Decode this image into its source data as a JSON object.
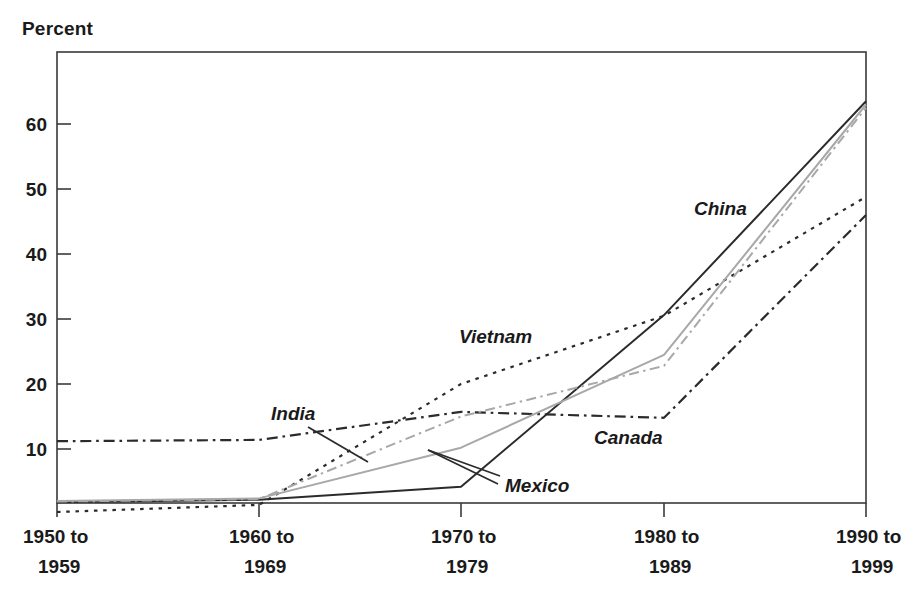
{
  "chart_data": {
    "type": "line",
    "title": "",
    "ylabel": "Percent",
    "xlabel": "",
    "ylim": [
      0,
      68
    ],
    "yticks": [
      10,
      20,
      30,
      40,
      50,
      60
    ],
    "ytick_labels": [
      "10",
      "20",
      "30",
      "40",
      "50",
      "60"
    ],
    "grid": false,
    "legend_position": "inline-annotations",
    "categories": [
      "1950 to 1959",
      "1960 to 1969",
      "1970 to 1979",
      "1980 to 1989",
      "1990 to 1999"
    ],
    "xtick_labels": [
      {
        "line1": "1950 to",
        "line2": "1959"
      },
      {
        "line1": "1960 to",
        "line2": "1969"
      },
      {
        "line1": "1970 to",
        "line2": "1979"
      },
      {
        "line1": "1980 to",
        "line2": "1989"
      },
      {
        "line1": "1990 to",
        "line2": "1999"
      }
    ],
    "series": [
      {
        "name": "China",
        "label": "China",
        "style": "solid",
        "color": "#2b2b2b",
        "width": 2.0,
        "values": [
          1.8,
          2.2,
          4.2,
          30.6,
          63.5
        ]
      },
      {
        "name": "Vietnam",
        "label": "Vietnam",
        "style": "dotted",
        "color": "#2b2b2b",
        "width": 2.2,
        "values": [
          0.3,
          1.4,
          20.0,
          30.5,
          48.8
        ]
      },
      {
        "name": "Canada",
        "label": "Canada",
        "style": "dashdot",
        "color": "#2b2b2b",
        "width": 2.2,
        "values": [
          11.2,
          11.4,
          15.7,
          14.8,
          46.0
        ]
      },
      {
        "name": "Mexico",
        "label": "Mexico",
        "style": "solid",
        "color": "#a8a8a8",
        "width": 2.0,
        "values": [
          2.0,
          2.4,
          10.2,
          24.5,
          63.0
        ]
      },
      {
        "name": "India",
        "label": "India",
        "style": "dashdot",
        "color": "#a8a8a8",
        "width": 2.0,
        "values": [
          1.9,
          2.3,
          15.0,
          22.8,
          62.5
        ]
      }
    ],
    "annotations": [
      {
        "text": "China",
        "series": "China"
      },
      {
        "text": "Vietnam",
        "series": "Vietnam"
      },
      {
        "text": "Canada",
        "series": "Canada"
      },
      {
        "text": "Mexico",
        "series": "Mexico"
      },
      {
        "text": "India",
        "series": "India"
      }
    ]
  },
  "axis": {
    "y_title": "Percent"
  },
  "colors": {
    "frame": "#3a3a3a",
    "dark_series": "#2b2b2b",
    "light_series": "#a8a8a8",
    "text": "#1a1a1a",
    "background": "#ffffff"
  }
}
